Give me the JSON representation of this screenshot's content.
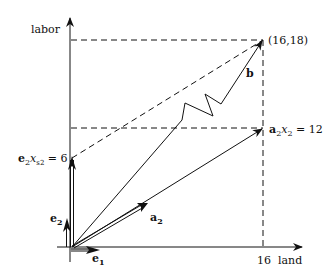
{
  "axes": {
    "y_label": "labor",
    "x_label": "land",
    "x_tick": "16"
  },
  "points": {
    "target_label": "(16,18)"
  },
  "vectors": {
    "b": "b",
    "a2": "a",
    "a2_sub": "2",
    "e1": "e",
    "e1_sub": "1",
    "e2": "e",
    "e2_sub": "2"
  },
  "annotations": {
    "a2x2_prefix": "a",
    "a2x2_sub": "2",
    "a2x2_x": "x",
    "a2x2_xsub": "2",
    "a2x2_value": " = 12",
    "e2xs2_prefix": "e",
    "e2xs2_sub": "2",
    "e2xs2_x": "x",
    "e2xs2_xsub": "s2",
    "e2xs2_value": " = 6"
  },
  "colors": {
    "ink": "#111111",
    "background": "#ffffff"
  }
}
